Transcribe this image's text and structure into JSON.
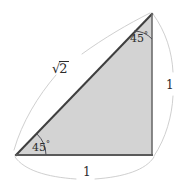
{
  "figure": {
    "kind": "geometry-diagram",
    "background_color": "#ffffff",
    "triangle": {
      "fill_color": "#d3d3d3",
      "stroke_color": "#4a4a4a",
      "vertices": [
        {
          "name": "apex",
          "x": 152,
          "y": 14
        },
        {
          "name": "bottom-left",
          "x": 16,
          "y": 155
        },
        {
          "name": "bottom-right",
          "x": 152,
          "y": 155
        }
      ]
    },
    "measure_arc_color": "#c8c8c8",
    "angle_arc_color": "#55555f",
    "angles": [
      {
        "id": "apex",
        "label": "45",
        "degree_symbol": "°"
      },
      {
        "id": "base-left",
        "label": "45",
        "degree_symbol": "°"
      }
    ],
    "sides": [
      {
        "id": "hypotenuse",
        "radical_sign": "√",
        "radicand": "2",
        "label": "√2"
      },
      {
        "id": "right-leg",
        "label": "1"
      },
      {
        "id": "base",
        "label": "1"
      }
    ]
  }
}
